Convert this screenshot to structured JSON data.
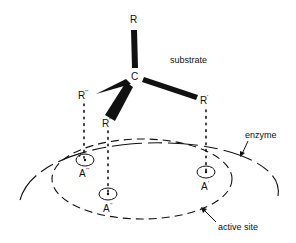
{
  "diagram": {
    "labels": {
      "substrate": "substrate",
      "enzyme": "enzyme",
      "active_site": "active site",
      "central_atom": "C",
      "R_top": "R",
      "R_prime": "R",
      "R_prime_mark": "'",
      "R_double": "R",
      "R_double_mark": "''",
      "R_triple": "R",
      "R_triple_mark": "'''",
      "A_prime": "A",
      "A_prime_mark": "'",
      "A_double": "A",
      "A_double_mark": "''",
      "A_triple": "A",
      "A_triple_mark": "'''"
    },
    "colors": {
      "ink": "#111111",
      "background": "#ffffff"
    }
  }
}
